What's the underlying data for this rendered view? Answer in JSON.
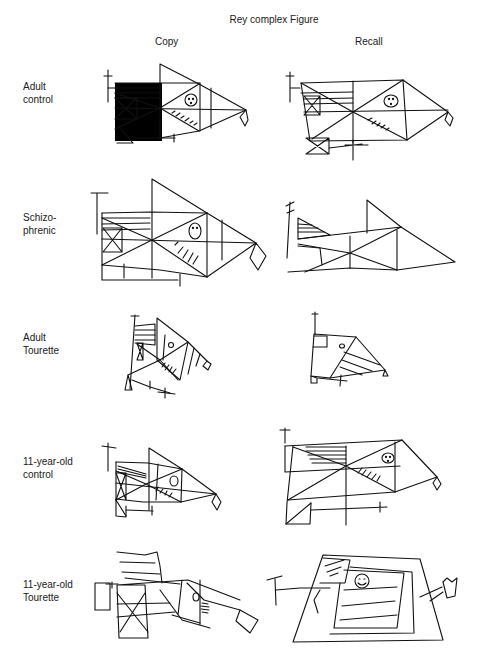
{
  "title": "Rey complex Figure",
  "columns": [
    {
      "label": "Copy"
    },
    {
      "label": "Recall"
    }
  ],
  "rows": [
    {
      "label_line1": "Adult",
      "label_line2": "control"
    },
    {
      "label_line1": "Schizo-",
      "label_line2": "phrenic"
    },
    {
      "label_line1": "Adult",
      "label_line2": "Tourette"
    },
    {
      "label_line1": "11-year-old",
      "label_line2": "control"
    },
    {
      "label_line1": "11-year-old",
      "label_line2": "Tourette"
    }
  ]
}
